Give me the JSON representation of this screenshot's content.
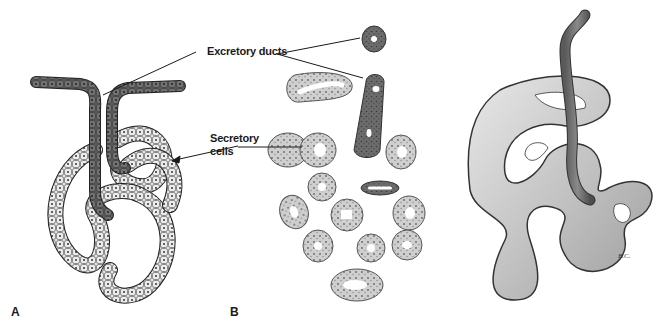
{
  "figure": {
    "panels": [
      {
        "id": "A",
        "label": "A",
        "description": "Coiled tubular gland, cellular detail"
      },
      {
        "id": "B",
        "label": "B",
        "description": "Cross sections of tubules"
      },
      {
        "id": "C",
        "label": "",
        "description": "Three-dimensional rendering of coiled gland"
      }
    ],
    "annotations": {
      "excretory_ducts": "Excretory ducts",
      "secretory_cells_line1": "Secretory",
      "secretory_cells_line2": "cells"
    },
    "signature": "B.C."
  },
  "colors": {
    "duct_dark": "#6a6a6a",
    "secretory_light": "#d8d8d8",
    "outline": "#222222",
    "panel_c_fill": "#c9c9c9",
    "panel_c_duct": "#7a7a7a"
  }
}
